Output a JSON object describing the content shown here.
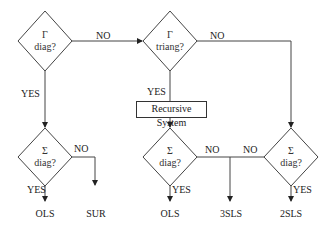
{
  "diagram": {
    "type": "flowchart",
    "nodes": {
      "gamma_diag": {
        "symbol": "Γ",
        "question": "diag?"
      },
      "gamma_triang": {
        "symbol": "Γ",
        "question": "triang?"
      },
      "recursive": {
        "label": "Recursive System"
      },
      "sigma_diag_left": {
        "symbol": "Σ",
        "question": "diag?"
      },
      "sigma_diag_mid": {
        "symbol": "Σ",
        "question": "diag?"
      },
      "sigma_diag_right": {
        "symbol": "Σ",
        "question": "diag?"
      }
    },
    "edge_labels": {
      "gamma_diag_no": "NO",
      "gamma_diag_yes": "YES",
      "gamma_triang_no": "NO",
      "gamma_triang_yes": "YES",
      "sigma_left_no": "NO",
      "sigma_left_yes": "YES",
      "sigma_mid_no": "NO",
      "sigma_mid_yes": "YES",
      "sigma_right_no": "NO",
      "sigma_right_yes": "YES"
    },
    "outcomes": {
      "ols_left": "OLS",
      "sur": "SUR",
      "ols_mid": "OLS",
      "three_sls": "3SLS",
      "two_sls": "2SLS"
    }
  }
}
